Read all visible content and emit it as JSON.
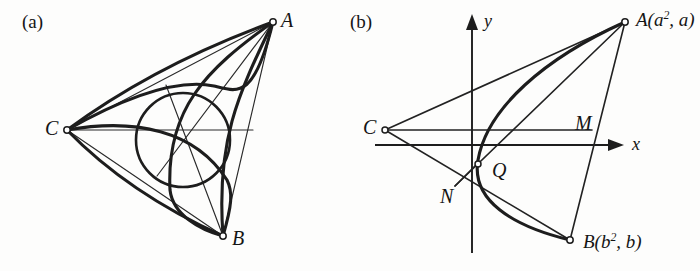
{
  "figure": {
    "background_color": "#fdfdfc",
    "ink_color": "#1d1d1d"
  },
  "panels": [
    {
      "id": "a",
      "tag": "(a)",
      "description": "Triangle ABC with three thick curved arcs and an inscribed circle",
      "vertices": [
        {
          "name": "A",
          "label": "A",
          "x": 273,
          "y": 22
        },
        {
          "name": "B",
          "label": "B",
          "x": 223,
          "y": 236
        },
        {
          "name": "C",
          "label": "C",
          "x": 67,
          "y": 130
        }
      ],
      "inscribed_circle": {
        "cx": 183,
        "cy": 140,
        "r": 47
      }
    },
    {
      "id": "b",
      "tag": "(b)",
      "description": "Parabola x = y-squared with chord AB, point C on the axis of symmetry side, and points M, N, Q",
      "axes": {
        "x_label": "x",
        "y_label": "y",
        "origin": {
          "x": 472,
          "y": 145
        }
      },
      "points": [
        {
          "name": "A",
          "label": "A(a², a)",
          "base": "A",
          "sub": "2",
          "x": 625,
          "y": 22
        },
        {
          "name": "B",
          "label": "B(b², b)",
          "base": "B",
          "sub": "2",
          "x": 570,
          "y": 240
        },
        {
          "name": "C",
          "label": "C",
          "x": 385,
          "y": 130
        },
        {
          "name": "M",
          "label": "M",
          "x": 570,
          "y": 130
        },
        {
          "name": "N",
          "label": "N",
          "x": 455,
          "y": 186
        },
        {
          "name": "Q",
          "label": "Q",
          "x": 478,
          "y": 165
        }
      ]
    }
  ],
  "labels": {
    "panel_a_tag": "(a)",
    "panel_b_tag": "(b)",
    "a_vertex_A": "A",
    "a_vertex_B": "B",
    "a_vertex_C": "C",
    "b_axis_x": "x",
    "b_axis_y": "y",
    "b_point_C": "C",
    "b_point_M": "M",
    "b_point_N": "N",
    "b_point_Q": "Q",
    "b_point_A_base": "A(a",
    "b_point_A_sup": "2",
    "b_point_A_tail": ", a)",
    "b_point_B_base": "B(b",
    "b_point_B_sup": "2",
    "b_point_B_tail": ", b)"
  }
}
